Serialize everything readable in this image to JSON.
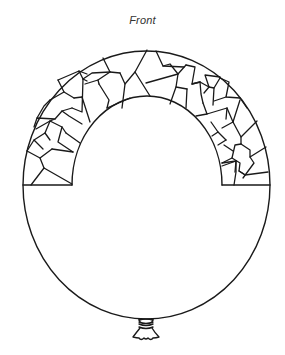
{
  "caption": {
    "label": "Front"
  },
  "illustration": {
    "subject": "balloon-outline",
    "pattern": "mosaic-arch",
    "colors": {
      "line": "#1a1a1a",
      "background": "#ffffff",
      "caption_text": "#333333"
    }
  }
}
